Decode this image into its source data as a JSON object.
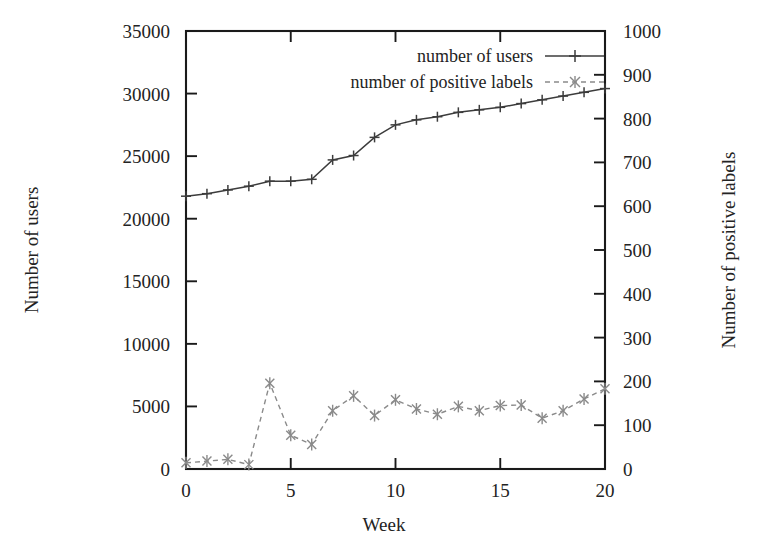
{
  "chart_data": {
    "type": "line",
    "title": "",
    "xlabel": "Week",
    "ylabel": "Number of users",
    "y2label": "Number of positive labels",
    "grid": false,
    "legend_position": "top-right",
    "xlim": [
      0,
      20
    ],
    "ylim": [
      0,
      35000
    ],
    "y2lim": [
      0,
      1000
    ],
    "xticks": [
      0,
      5,
      10,
      15,
      20
    ],
    "xticklabels": [
      "0",
      "5",
      "10",
      "15",
      "20"
    ],
    "yticks": [
      0,
      5000,
      10000,
      15000,
      20000,
      25000,
      30000,
      35000
    ],
    "yticklabels": [
      "0",
      "5000",
      "10000",
      "15000",
      "20000",
      "25000",
      "30000",
      "35000"
    ],
    "y2ticks": [
      0,
      100,
      200,
      300,
      400,
      500,
      600,
      700,
      800,
      900,
      1000
    ],
    "y2ticklabels": [
      "0",
      "100",
      "200",
      "300",
      "400",
      "500",
      "600",
      "700",
      "800",
      "900",
      "1000"
    ],
    "x": [
      0,
      1,
      2,
      3,
      4,
      5,
      6,
      7,
      8,
      9,
      10,
      11,
      12,
      13,
      14,
      15,
      16,
      17,
      18,
      19,
      20
    ],
    "series": [
      {
        "name": "number of users",
        "axis": "left",
        "marker": "plus",
        "linestyle": "solid",
        "color": "#3c3c3c",
        "values": [
          21800,
          22000,
          22300,
          22600,
          23000,
          23000,
          23150,
          24700,
          25050,
          26500,
          27500,
          27900,
          28150,
          28500,
          28700,
          28900,
          29200,
          29500,
          29800,
          30100,
          30400
        ]
      },
      {
        "name": "number of positive labels",
        "axis": "right",
        "marker": "star",
        "linestyle": "dashed",
        "color": "#8a8a8a",
        "values": [
          14,
          18,
          22,
          10,
          196,
          77,
          56,
          133,
          167,
          122,
          158,
          137,
          125,
          143,
          133,
          145,
          146,
          116,
          133,
          160,
          183
        ]
      }
    ]
  },
  "legend": {
    "entries": [
      {
        "label": "number of users",
        "marker": "plus",
        "style": "solid"
      },
      {
        "label": "number of positive labels",
        "marker": "star",
        "style": "dashed"
      }
    ]
  },
  "axes": {
    "x_title": "Week",
    "y_title": "Number of users",
    "y2_title": "Number of positive labels"
  }
}
